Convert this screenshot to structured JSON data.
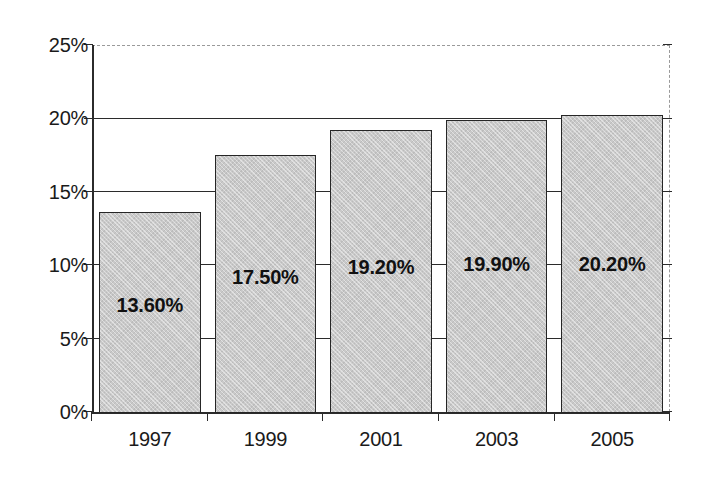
{
  "chart_data": {
    "type": "bar",
    "title": "",
    "subtitle": "",
    "xlabel": "",
    "ylabel": "",
    "categories": [
      "1997",
      "1999",
      "2001",
      "2003",
      "2005"
    ],
    "values": [
      13.6,
      17.5,
      19.2,
      19.9,
      20.2
    ],
    "data_labels": [
      "13.60%",
      "17.50%",
      "19.20%",
      "19.90%",
      "20.20%"
    ],
    "ylim": [
      0,
      25
    ],
    "ytick_values": [
      0,
      5,
      10,
      15,
      20,
      25
    ],
    "ytick_labels": [
      "0%",
      "5%",
      "10%",
      "15%",
      "20%",
      "25%"
    ],
    "grid": true,
    "grid_axis": "y",
    "legend": null,
    "legend_position": "none",
    "annotations": [],
    "series": [
      {
        "name": "",
        "values": [
          13.6,
          17.5,
          19.2,
          19.9,
          20.2
        ]
      }
    ],
    "style": {
      "bar_fill": "#c9c9c9",
      "bar_border": "#262626",
      "gridline_color": "#2b2b2b",
      "frame_dashed_color": "#9a9a9a",
      "text_color": "#1a1a1a",
      "background": "#ffffff"
    }
  }
}
